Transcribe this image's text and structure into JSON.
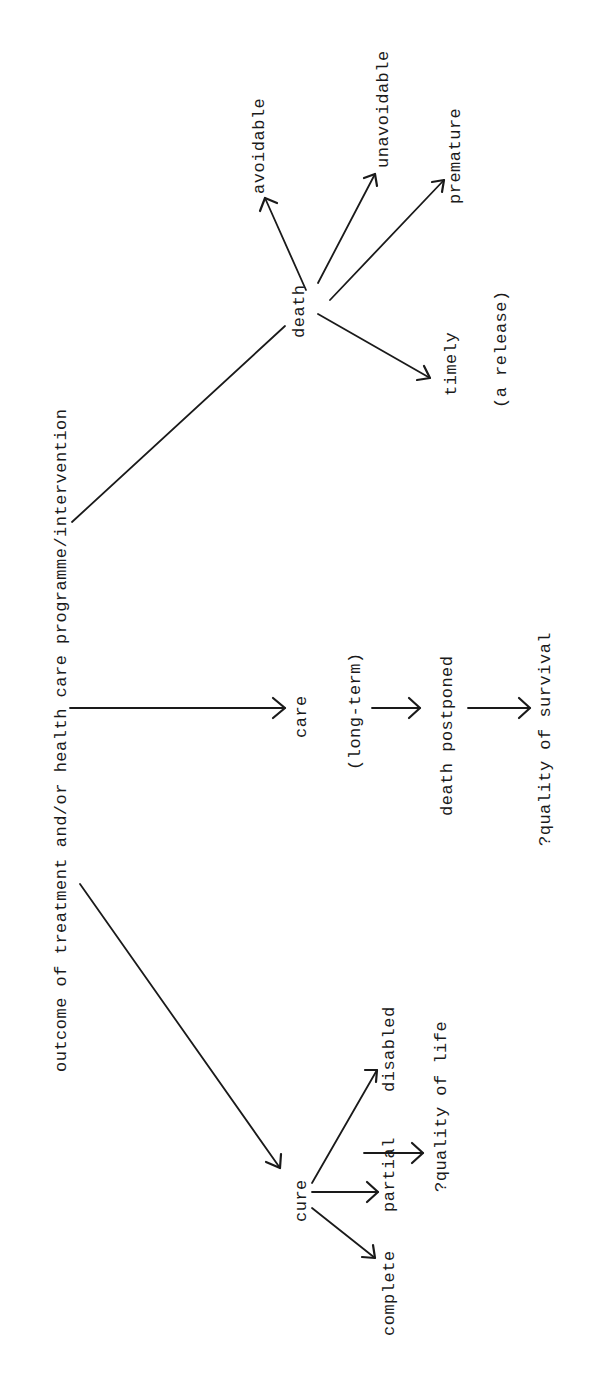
{
  "diagram": {
    "root": "outcome of treatment and/or health care programme/intervention",
    "branches": {
      "death": {
        "label": "death",
        "children": [
          "avoidable",
          "unavoidable",
          "premature",
          "timely"
        ],
        "note": "(a release)"
      },
      "care": {
        "label": "care",
        "qualifier": "(long-term)",
        "next": "death postponed",
        "outcome": "?quality of survival"
      },
      "cure": {
        "label": "cure",
        "children": [
          "disabled",
          "partial",
          "complete"
        ],
        "outcome": "?quality of life"
      }
    },
    "ink_color": "#1a1a1a",
    "background": "#ffffff"
  }
}
